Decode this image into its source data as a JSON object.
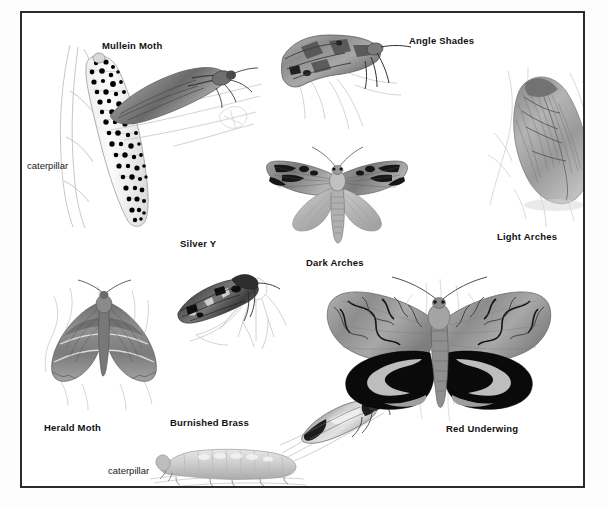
{
  "plate": {
    "title": "Moths illustration plate",
    "background_color": "#ffffff",
    "page_color": "#fdfdfd",
    "border_color": "#2b2b2b",
    "ink_color": "#111111"
  },
  "labels": {
    "mullein_moth": "Mullein Moth",
    "angle_shades": "Angle Shades",
    "light_arches": "Light Arches",
    "dark_arches": "Dark Arches",
    "silver_y": "Silver Y",
    "herald_moth": "Herald Moth",
    "burnished_brass": "Burnished Brass",
    "red_underwing": "Red Underwing",
    "caterpillar_left": "caterpillar",
    "caterpillar_bottom": "caterpillar"
  },
  "figures": [
    {
      "name": "mullein-moth-caterpillar",
      "label": "caterpillar",
      "kind": "caterpillar",
      "species": "Mullein Moth"
    },
    {
      "name": "mullein-moth-adult",
      "label": "Mullein Moth",
      "kind": "moth-resting",
      "species": "Mullein Moth"
    },
    {
      "name": "angle-shades-adult",
      "label": "Angle Shades",
      "kind": "moth-resting",
      "species": "Angle Shades"
    },
    {
      "name": "light-arches-adult",
      "label": "Light Arches",
      "kind": "moth-resting",
      "species": "Light Arches"
    },
    {
      "name": "dark-arches-adult",
      "label": "Dark Arches",
      "kind": "moth-spread",
      "species": "Dark Arches"
    },
    {
      "name": "silver-y-adult",
      "label": "Silver Y",
      "kind": "moth-on-flower",
      "species": "Silver Y"
    },
    {
      "name": "herald-moth-adult",
      "label": "Herald Moth",
      "kind": "moth-spread",
      "species": "Herald Moth"
    },
    {
      "name": "burnished-brass-adult",
      "label": "Burnished Brass",
      "kind": "moth-resting",
      "species": "Burnished Brass"
    },
    {
      "name": "burnished-brass-caterpillar",
      "label": "caterpillar",
      "kind": "caterpillar",
      "species": "Burnished Brass"
    },
    {
      "name": "red-underwing-adult",
      "label": "Red Underwing",
      "kind": "moth-spread",
      "species": "Red Underwing"
    }
  ]
}
